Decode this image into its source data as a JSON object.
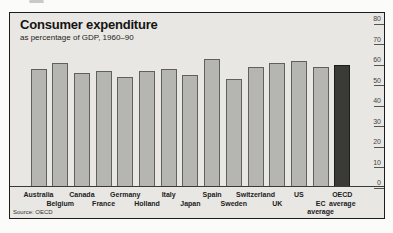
{
  "page": {
    "background": "#fbfbf9"
  },
  "chart": {
    "title": "Consumer expenditure",
    "subtitle": "as percentage of GDP, 1960–90",
    "source": "Source: OECD",
    "x_labels": [
      {
        "line1": "Australia",
        "row": 1
      },
      {
        "line1": "Belgium",
        "row": 2
      },
      {
        "line1": "Canada",
        "row": 1
      },
      {
        "line1": "France",
        "row": 2
      },
      {
        "line1": "Germany",
        "row": 1
      },
      {
        "line1": "Holland",
        "row": 2
      },
      {
        "line1": "Italy",
        "row": 1
      },
      {
        "line1": "Japan",
        "row": 2
      },
      {
        "line1": "Spain",
        "row": 1
      },
      {
        "line1": "Sweden",
        "row": 2
      },
      {
        "line1": "Switzerland",
        "row": 1
      },
      {
        "line1": "UK",
        "row": 2
      },
      {
        "line1": "US",
        "row": 1
      },
      {
        "line1": "EC",
        "line2": "average",
        "row": 2
      },
      {
        "line1": "OECD",
        "line2": "average",
        "row": 1
      }
    ]
  },
  "chart_data": {
    "type": "bar",
    "title": "Consumer expenditure",
    "subtitle": "as percentage of GDP, 1960–90",
    "source": "Source: OECD",
    "categories": [
      "Australia",
      "Belgium",
      "Canada",
      "France",
      "Germany",
      "Holland",
      "Italy",
      "Japan",
      "Spain",
      "Sweden",
      "Switzerland",
      "UK",
      "US",
      "EC average",
      "OECD average"
    ],
    "values": [
      57,
      60,
      55,
      56,
      53,
      56,
      57,
      54,
      62,
      52,
      58,
      60,
      61,
      58,
      59
    ],
    "xlabel": "",
    "ylabel": "",
    "ylim": [
      0,
      80
    ],
    "yticks": [
      0,
      10,
      20,
      30,
      40,
      50,
      60,
      70,
      80
    ],
    "ytick_labels": [
      "0",
      "10",
      "20",
      "30",
      "40",
      "50",
      "60",
      "70",
      "80"
    ],
    "axis_side": "right",
    "grid": false,
    "legend": "none",
    "highlight_category": "OECD average",
    "colors": {
      "bar_fill": "#b5b5b2",
      "bar_stroke": "#60605c",
      "highlight_fill": "#3a3a37",
      "highlight_stroke": "#1c1c1a",
      "plot_background": "#e9e7e3",
      "frame_border": "#1c1c1a"
    }
  }
}
